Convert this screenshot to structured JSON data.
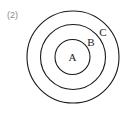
{
  "part_label": "(2)",
  "diagram": {
    "type": "concentric-circles",
    "stroke_color": "#1a1a1a",
    "circles": [
      {
        "label": "A",
        "cx": 72.5,
        "cy": 57,
        "r": 17.5,
        "label_x": 72.5,
        "label_y": 61
      },
      {
        "label": "B",
        "cx": 73,
        "cy": 57,
        "r": 32.5,
        "label_x": 91,
        "label_y": 46
      },
      {
        "label": "C",
        "cx": 73,
        "cy": 57,
        "r": 46,
        "label_x": 103,
        "label_y": 36
      }
    ]
  }
}
